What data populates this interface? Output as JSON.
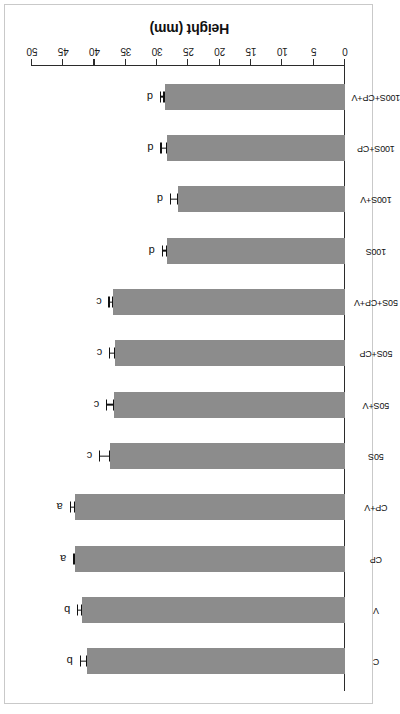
{
  "figure": {
    "axis_title": "Height (mm)",
    "bar_color": "#8c8c8c",
    "axis_color": "#2b2b2b",
    "text_color": "#111111",
    "rotation_degrees": 180
  },
  "chart_data": {
    "type": "bar",
    "orientation": "horizontal",
    "title": "",
    "xlabel": "",
    "ylabel": "Height (mm)",
    "ylim": [
      0,
      50
    ],
    "yticks": [
      0,
      5,
      10,
      15,
      20,
      25,
      30,
      35,
      40,
      45,
      50
    ],
    "ytick_labels": [
      "0",
      "5",
      "10",
      "15",
      "20",
      "25",
      "30",
      "35",
      "40",
      "45",
      "50"
    ],
    "grid": false,
    "legend": null,
    "categories": [
      "C",
      "V",
      "CP",
      "CP+V",
      "50S",
      "50S+V",
      "50S+CP",
      "50S+CP+V",
      "100S",
      "100S+V",
      "100S+CP",
      "100S+CP+V"
    ],
    "values": [
      41.2,
      42.0,
      43.1,
      43.1,
      37.5,
      36.9,
      36.7,
      37.0,
      28.4,
      26.7,
      28.4,
      28.8
    ],
    "errors": [
      1.0,
      0.6,
      0.15,
      0.7,
      1.6,
      1.1,
      0.8,
      0.6,
      0.7,
      1.1,
      0.9,
      0.6
    ],
    "annotations": [
      "b",
      "b",
      "a",
      "a",
      "c",
      "c",
      "c",
      "c",
      "d",
      "d",
      "d",
      "d"
    ],
    "annotation_label": "significance group letters"
  }
}
